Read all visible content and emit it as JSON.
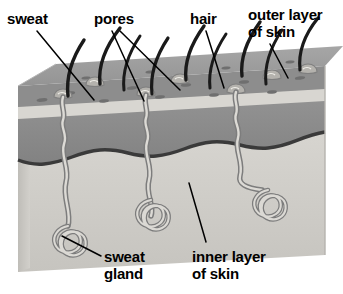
{
  "figure": {
    "background_color": "#ffffff"
  },
  "labels": [
    {
      "id": "sweat",
      "text": "sweat",
      "x": 7,
      "y": 10
    },
    {
      "id": "pores",
      "text": "pores",
      "x": 94,
      "y": 10
    },
    {
      "id": "hair",
      "text": "hair",
      "x": 190,
      "y": 10
    },
    {
      "id": "outer-layer",
      "text": "outer layer",
      "x": 248,
      "y": 6
    },
    {
      "id": "outer-layer2",
      "text": "of skin",
      "x": 248,
      "y": 23
    },
    {
      "id": "sweat-gland",
      "text": "sweat",
      "x": 104,
      "y": 248
    },
    {
      "id": "sweat-gland2",
      "text": "gland",
      "x": 104,
      "y": 265
    },
    {
      "id": "inner-layer",
      "text": "inner layer",
      "x": 192,
      "y": 248
    },
    {
      "id": "inner-layer2",
      "text": "of skin",
      "x": 192,
      "y": 265
    }
  ],
  "colors": {
    "epidermis_top": "#9c9c9c",
    "epidermis_side": "#8f8f8f",
    "pale_band": "#d6d4cf",
    "dermis_band": "#8a8a8a",
    "inner_layer": "#cfcdc8",
    "inner_layer_side": "#c2c0bb",
    "boundary_line": "#3a3a3a",
    "hair_color": "#1a1a1a",
    "duct_outline": "#7d7d7d",
    "duct_fill": "#d8d6d1",
    "leader_line": "#000000",
    "text": "#000000"
  },
  "parts": {
    "hairs_count": 9,
    "pore_marks_count": 14,
    "sweat_glands_count": 3,
    "gland_positions": [
      "left",
      "center",
      "right"
    ]
  },
  "leader_lines": [
    {
      "id": "leader-sweat",
      "from": [
        35,
        30
      ],
      "to": [
        92,
        98
      ]
    },
    {
      "id": "leader-pores-a",
      "from": [
        112,
        30
      ],
      "to": [
        143,
        100
      ]
    },
    {
      "id": "leader-pores-b",
      "from": [
        120,
        30
      ],
      "to": [
        178,
        92
      ]
    },
    {
      "id": "leader-hair",
      "from": [
        205,
        30
      ],
      "to": [
        222,
        88
      ]
    },
    {
      "id": "leader-outer",
      "from": [
        268,
        42
      ],
      "to": [
        285,
        78
      ]
    },
    {
      "id": "leader-sweat-gland",
      "from": [
        100,
        256
      ],
      "to": [
        62,
        237
      ]
    },
    {
      "id": "leader-inner",
      "from": [
        205,
        242
      ],
      "to": [
        188,
        185
      ]
    }
  ]
}
